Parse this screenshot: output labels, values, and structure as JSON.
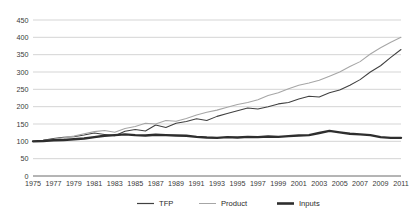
{
  "chart_data": {
    "type": "line",
    "title": "",
    "subtitle": "",
    "xlabel": "",
    "ylabel": "",
    "ylim": [
      0,
      450
    ],
    "yticks": [
      0,
      50,
      100,
      150,
      200,
      250,
      300,
      350,
      400,
      450
    ],
    "grid": true,
    "legend_position": "bottom",
    "x": [
      1975,
      1976,
      1977,
      1978,
      1979,
      1980,
      1981,
      1982,
      1983,
      1984,
      1985,
      1986,
      1987,
      1988,
      1989,
      1990,
      1991,
      1992,
      1993,
      1994,
      1995,
      1996,
      1997,
      1998,
      1999,
      2000,
      2001,
      2002,
      2003,
      2004,
      2005,
      2006,
      2007,
      2008,
      2009,
      2010,
      2011
    ],
    "xtick_labels": [
      1975,
      1977,
      1979,
      1981,
      1983,
      1985,
      1987,
      1989,
      1991,
      1993,
      1995,
      1997,
      1999,
      2001,
      2003,
      2005,
      2007,
      2009,
      2011
    ],
    "series": [
      {
        "name": "TFP",
        "color": "#404040",
        "width": 1.05,
        "values": [
          100,
          103,
          108,
          112,
          113,
          118,
          124,
          120,
          116,
          129,
          134,
          130,
          147,
          140,
          152,
          157,
          165,
          160,
          172,
          180,
          188,
          196,
          193,
          200,
          208,
          212,
          222,
          230,
          228,
          240,
          248,
          262,
          278,
          300,
          318,
          342,
          365
        ]
      },
      {
        "name": "Product",
        "color": "#a6a6a6",
        "width": 1.05,
        "values": [
          100,
          102,
          106,
          110,
          115,
          122,
          128,
          131,
          126,
          137,
          143,
          152,
          150,
          160,
          158,
          166,
          176,
          184,
          190,
          198,
          206,
          212,
          220,
          232,
          240,
          252,
          262,
          268,
          276,
          288,
          300,
          316,
          330,
          352,
          370,
          386,
          400
        ]
      },
      {
        "name": "Inputs",
        "color": "#2e2e2e",
        "width": 2.4,
        "values": [
          100,
          101,
          103,
          104,
          106,
          108,
          112,
          116,
          118,
          120,
          118,
          117,
          119,
          118,
          117,
          116,
          113,
          111,
          110,
          112,
          111,
          113,
          112,
          114,
          113,
          115,
          117,
          118,
          124,
          130,
          126,
          122,
          120,
          118,
          112,
          110,
          110
        ]
      }
    ],
    "legend": [
      {
        "label": "TFP",
        "color": "#404040",
        "width": 1.2
      },
      {
        "label": "Product",
        "color": "#a6a6a6",
        "width": 1.0
      },
      {
        "label": "Inputs",
        "color": "#2e2e2e",
        "width": 2.6
      }
    ]
  }
}
